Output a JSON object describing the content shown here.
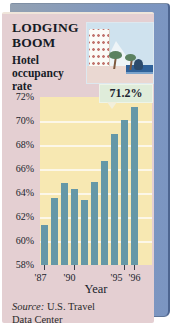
{
  "header": {
    "title": "LODGING BOOM",
    "subtitle": "Hotel occupancy rate"
  },
  "source": {
    "prefix": "Source:",
    "text": "U.S. Travel Data Center"
  },
  "colors": {
    "page_bg": "#ffffff",
    "panel_blue": "#7e97c0",
    "panel_blue_edge": "#4d6590",
    "card_pink": "#e4cfd2",
    "plot_yellow": "#f7e8b2",
    "gridline_white": "#fcf7e8",
    "bar_teal": "#6598a7",
    "callout_mint": "#dfecda",
    "text_dark": "#1b212c"
  },
  "chart_data": {
    "type": "bar",
    "title": "LODGING BOOM",
    "subtitle": "Hotel occupancy rate",
    "categories": [
      "'87",
      "'88",
      "'89",
      "'90",
      "'91",
      "'92",
      "'93",
      "'94",
      "'95",
      "'96"
    ],
    "values": [
      61.3,
      63.6,
      64.8,
      64.3,
      63.4,
      64.9,
      66.7,
      68.9,
      70.1,
      71.2
    ],
    "xlabel": "Year",
    "ylabel": "Hotel occupancy rate (%)",
    "ylim": [
      58,
      72
    ],
    "y_tick_labels": [
      "72%",
      "70%",
      "68%",
      "66%",
      "64%",
      "62%",
      "60%",
      "58%"
    ],
    "x_tick_labels_shown": [
      {
        "index": 0,
        "label": "'87"
      },
      {
        "index": 3,
        "label": "'90"
      },
      {
        "index": 8,
        "label": "'95"
      },
      {
        "index": 9,
        "label": "'96"
      }
    ],
    "grid": true,
    "legend": false,
    "annotation": {
      "text": "71.2%",
      "target": "'96"
    }
  }
}
